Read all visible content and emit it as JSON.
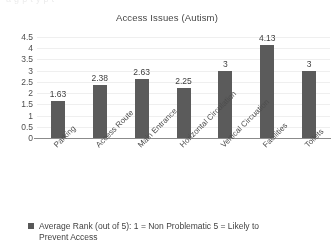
{
  "scan": {
    "top_artifact": "a            g                        p                      t        y p        t"
  },
  "chart_data": {
    "type": "bar",
    "title": "Access Issues (Autism)",
    "xlabel": "",
    "ylabel": "",
    "categories": [
      "Parking",
      "Access Route",
      "Main Entrance",
      "Horizontal Circulation",
      "Vertical Circuation",
      "Facilities",
      "Toilets"
    ],
    "values": [
      1.63,
      2.38,
      2.63,
      2.25,
      3,
      4.13,
      3
    ],
    "value_labels": [
      "1.63",
      "2.38",
      "2.63",
      "2.25",
      "3",
      "4.13",
      "3"
    ],
    "ylim": [
      0,
      4.5
    ],
    "yticks": [
      0,
      0.5,
      1,
      1.5,
      2,
      2.5,
      3,
      3.5,
      4,
      4.5
    ],
    "ytick_labels": [
      "0",
      "0.5",
      "1",
      "1.5",
      "2",
      "2.5",
      "3",
      "3.5",
      "4",
      "4.5"
    ],
    "grid": true,
    "legend_position": "bottom",
    "series": [
      {
        "name": "Average Rank (out of 5): 1 = Non Problematic 5 = Likely to Prevent Access",
        "values": [
          1.63,
          2.38,
          2.63,
          2.25,
          3,
          4.13,
          3
        ],
        "color": "#585858"
      }
    ]
  },
  "legend": {
    "line1": "Average Rank (out of 5): 1 = Non Problematic 5 = Likely to",
    "line2": "Prevent Access"
  },
  "colors": {
    "bar": "#585858",
    "axis": "#8a8a8a",
    "grid": "#f2f2f2",
    "text": "#3a3a3a",
    "background": "#ffffff"
  }
}
